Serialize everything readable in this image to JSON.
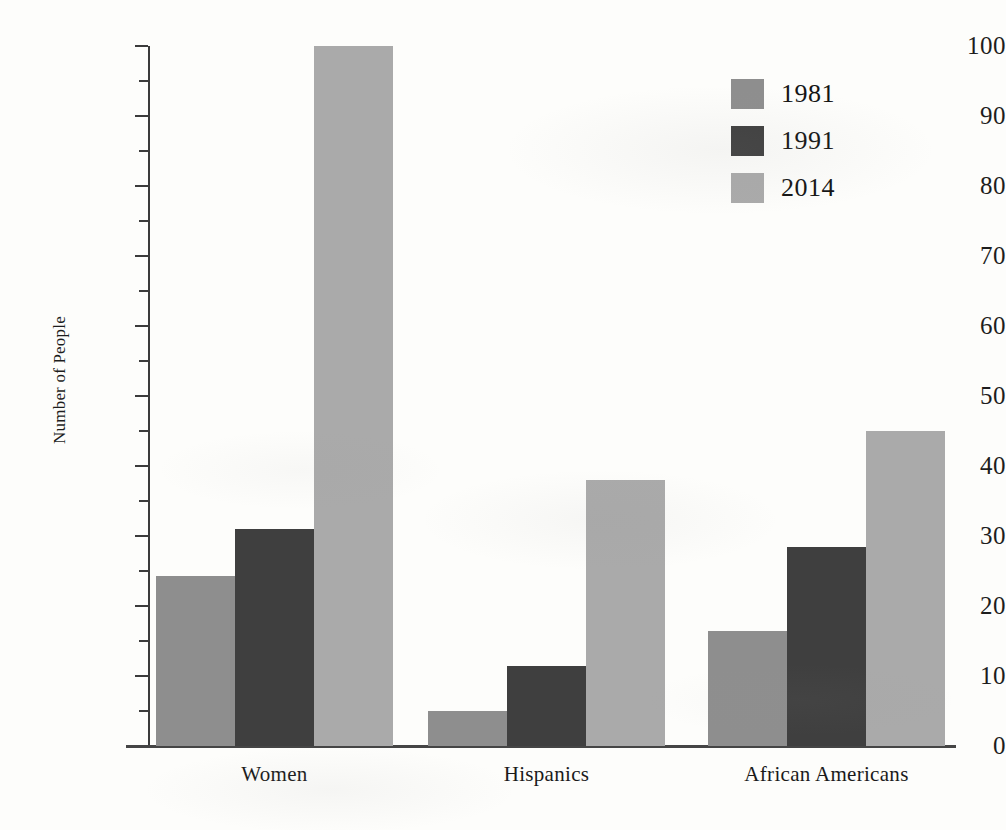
{
  "chart_data": {
    "type": "bar",
    "title": "",
    "xlabel": "",
    "ylabel": "Number of People",
    "ylim": [
      0,
      100
    ],
    "ytick_step": 10,
    "yminor_step": 5,
    "grid": false,
    "legend_position": "top-right",
    "categories": [
      "Women",
      "Hispanics",
      "African Americans"
    ],
    "yticks": [
      "0",
      "10",
      "20",
      "30",
      "40",
      "50",
      "60",
      "70",
      "80",
      "90",
      "100"
    ],
    "series": [
      {
        "name": "1981",
        "color": "#8e8e8e",
        "values": [
          24.3,
          5.0,
          16.5
        ]
      },
      {
        "name": "1991",
        "color": "#3f3f3f",
        "values": [
          31.0,
          11.5,
          28.5
        ]
      },
      {
        "name": "2014",
        "color": "#aaaaaa",
        "values": [
          100.0,
          38.0,
          45.0
        ]
      }
    ]
  }
}
